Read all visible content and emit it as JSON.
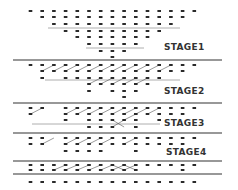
{
  "diagram": {
    "colors": {
      "dot": "#2a2a2a",
      "line": "#333333",
      "subline": "#9a9a9a",
      "connector": "#555555",
      "label": "#333333"
    },
    "grid": {
      "x0": 30.5,
      "dx": 11.7
    },
    "stages": [
      {
        "label": "STAGE1",
        "label_pos": [
          164,
          50
        ]
      },
      {
        "label": "STAGE2",
        "label_pos": [
          164,
          94
        ]
      },
      {
        "label": "STAGE3",
        "label_pos": [
          164,
          126
        ]
      },
      {
        "label": "STAGE4",
        "label_pos": [
          166,
          155
        ]
      }
    ],
    "separator_lines": [
      {
        "y": 60,
        "x1": 13,
        "x2": 222
      },
      {
        "y": 103,
        "x1": 13,
        "x2": 222
      },
      {
        "y": 133,
        "x1": 13,
        "x2": 222
      },
      {
        "y": 161,
        "x1": 13,
        "x2": 222
      },
      {
        "y": 174,
        "x1": 13,
        "x2": 222
      }
    ],
    "sub_lines": [
      {
        "y": 28,
        "x1": 48,
        "x2": 180
      },
      {
        "y": 48,
        "x1": 86,
        "x2": 144
      },
      {
        "y": 80,
        "x1": 45,
        "x2": 180
      },
      {
        "y": 124,
        "x1": 32,
        "x2": 160
      }
    ],
    "dot_rows": [
      {
        "y": 11,
        "cols": [
          0,
          1,
          2,
          3,
          4,
          5,
          6,
          7,
          8,
          9,
          10,
          11,
          12,
          13,
          14
        ]
      },
      {
        "y": 17,
        "cols": [
          1,
          2,
          3,
          4,
          5,
          6,
          7,
          8,
          9,
          10,
          11,
          12,
          13
        ]
      },
      {
        "y": 24,
        "cols": [
          2,
          3,
          4,
          5,
          6,
          7,
          8,
          9,
          10,
          11,
          12
        ]
      },
      {
        "y": 31,
        "cols": [
          3,
          4,
          5,
          6,
          7,
          8,
          9,
          10,
          11
        ]
      },
      {
        "y": 37,
        "cols": [
          4,
          5,
          6,
          7,
          8,
          9,
          10
        ]
      },
      {
        "y": 44,
        "cols": [
          5,
          6,
          7,
          8,
          9
        ]
      },
      {
        "y": 51,
        "cols": [
          6,
          7,
          8
        ]
      },
      {
        "y": 57,
        "cols": [
          7
        ]
      },
      {
        "y": 65,
        "cols": [
          0,
          1,
          2,
          3,
          4,
          5,
          6,
          7,
          8,
          9,
          10,
          11,
          12,
          13,
          14
        ]
      },
      {
        "y": 71,
        "cols": [
          1,
          2,
          3,
          4,
          5,
          6,
          7,
          8,
          9,
          10,
          11,
          12,
          13
        ]
      },
      {
        "y": 78,
        "cols": [
          1,
          3,
          4,
          5,
          6,
          7,
          8,
          9,
          10,
          11
        ]
      },
      {
        "y": 84,
        "cols": [
          5,
          6,
          7,
          8,
          9,
          10
        ]
      },
      {
        "y": 91,
        "cols": [
          5,
          7,
          8,
          9
        ]
      },
      {
        "y": 97,
        "cols": [
          8
        ]
      },
      {
        "y": 108,
        "cols": [
          0,
          1,
          3,
          4,
          5,
          6,
          7,
          8,
          9,
          10,
          11,
          12,
          13,
          14
        ]
      },
      {
        "y": 114,
        "cols": [
          0,
          3,
          4,
          5,
          6,
          7,
          8,
          9,
          10,
          11,
          12,
          13
        ]
      },
      {
        "y": 120,
        "cols": [
          3,
          5,
          6,
          7,
          8,
          9,
          11
        ]
      },
      {
        "y": 127,
        "cols": [
          5,
          6,
          7,
          9
        ]
      },
      {
        "y": 138,
        "cols": [
          0,
          1,
          3,
          4,
          5,
          6,
          7,
          8,
          9,
          10,
          11,
          12,
          13,
          14
        ]
      },
      {
        "y": 144,
        "cols": [
          0,
          1,
          3,
          4,
          5,
          6,
          7,
          8,
          9,
          10,
          11,
          12,
          13
        ]
      },
      {
        "y": 151,
        "cols": [
          3,
          4,
          5,
          6,
          9
        ]
      },
      {
        "y": 157,
        "cols": []
      },
      {
        "y": 165,
        "cols": [
          0,
          1,
          2,
          3,
          4,
          5,
          6,
          7,
          8,
          9,
          10,
          11,
          12,
          13,
          14
        ]
      },
      {
        "y": 170,
        "cols": [
          0,
          1,
          2,
          3,
          4,
          5,
          6,
          7,
          8,
          9,
          13
        ]
      },
      {
        "y": 182,
        "cols": [
          0,
          1,
          2,
          3,
          4,
          5,
          6,
          7,
          8,
          9,
          10,
          11,
          12,
          13,
          14
        ]
      }
    ],
    "connectors": [
      {
        "from": [
          1,
          71
        ],
        "to": [
          2,
          65
        ]
      },
      {
        "from": [
          2,
          71
        ],
        "to": [
          3,
          65
        ]
      },
      {
        "from": [
          3,
          71
        ],
        "to": [
          4,
          65
        ]
      },
      {
        "from": [
          4,
          71
        ],
        "to": [
          5,
          65
        ]
      },
      {
        "from": [
          5,
          71
        ],
        "to": [
          6,
          65
        ]
      },
      {
        "from": [
          6,
          71
        ],
        "to": [
          7,
          65
        ]
      },
      {
        "from": [
          7,
          71
        ],
        "to": [
          8,
          65
        ]
      },
      {
        "from": [
          8,
          71
        ],
        "to": [
          9,
          65
        ]
      },
      {
        "from": [
          9,
          71
        ],
        "to": [
          10,
          65
        ]
      },
      {
        "from": [
          10,
          71
        ],
        "to": [
          11,
          65
        ]
      },
      {
        "from": [
          11,
          71
        ],
        "to": [
          12,
          65
        ]
      },
      {
        "from": [
          5,
          84
        ],
        "to": [
          6,
          78
        ]
      },
      {
        "from": [
          6,
          84
        ],
        "to": [
          7,
          78
        ]
      },
      {
        "from": [
          7,
          84
        ],
        "to": [
          8,
          78
        ]
      },
      {
        "from": [
          8,
          84
        ],
        "to": [
          9,
          78
        ]
      },
      {
        "from": [
          9,
          84
        ],
        "to": [
          10,
          78
        ]
      },
      {
        "from": [
          0,
          114
        ],
        "to": [
          1,
          108
        ]
      },
      {
        "from": [
          3,
          114
        ],
        "to": [
          4,
          108
        ]
      },
      {
        "from": [
          4,
          114
        ],
        "to": [
          5,
          108
        ]
      },
      {
        "from": [
          5,
          114
        ],
        "to": [
          6,
          108
        ]
      },
      {
        "from": [
          6,
          114
        ],
        "to": [
          7,
          108
        ]
      },
      {
        "from": [
          7,
          114
        ],
        "to": [
          8,
          108
        ]
      },
      {
        "from": [
          8,
          114
        ],
        "to": [
          9,
          108
        ]
      },
      {
        "from": [
          9,
          114
        ],
        "to": [
          10,
          108
        ]
      },
      {
        "from": [
          10,
          114
        ],
        "to": [
          11,
          108
        ]
      },
      {
        "from": [
          7,
          127
        ],
        "to": [
          8,
          120
        ]
      },
      {
        "from": [
          7,
          120
        ],
        "to": [
          8,
          127
        ]
      },
      {
        "from": [
          8,
          120
        ],
        "to": [
          9,
          114
        ]
      },
      {
        "from": [
          1,
          144
        ],
        "to": [
          2,
          138
        ]
      },
      {
        "from": [
          3,
          144
        ],
        "to": [
          4,
          138
        ]
      },
      {
        "from": [
          4,
          144
        ],
        "to": [
          5,
          138
        ]
      },
      {
        "from": [
          5,
          144
        ],
        "to": [
          6,
          138
        ]
      },
      {
        "from": [
          6,
          144
        ],
        "to": [
          7,
          138
        ]
      },
      {
        "from": [
          8,
          144
        ],
        "to": [
          9,
          138
        ]
      },
      {
        "from": [
          2,
          170
        ],
        "to": [
          3,
          165
        ]
      },
      {
        "from": [
          3,
          170
        ],
        "to": [
          4,
          165
        ]
      },
      {
        "from": [
          4,
          170
        ],
        "to": [
          5,
          165
        ]
      },
      {
        "from": [
          5,
          170
        ],
        "to": [
          6,
          165
        ]
      },
      {
        "from": [
          6,
          170
        ],
        "to": [
          7,
          165
        ]
      },
      {
        "from": [
          7,
          170
        ],
        "to": [
          8,
          165
        ]
      },
      {
        "from": [
          8,
          170
        ],
        "to": [
          9,
          165
        ]
      },
      {
        "from": [
          7,
          165
        ],
        "to": [
          8,
          170
        ]
      },
      {
        "from": [
          8,
          165
        ],
        "to": [
          9,
          170
        ]
      }
    ]
  }
}
